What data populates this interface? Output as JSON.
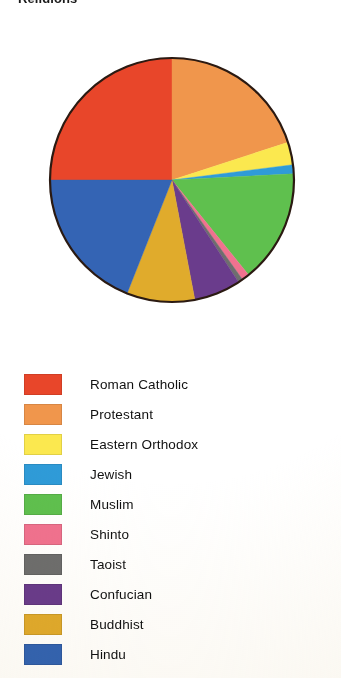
{
  "title": "Religions",
  "chart_data": {
    "type": "pie",
    "title": "Religions",
    "xlabel": "",
    "ylabel": "",
    "legend_position": "bottom",
    "grid": false,
    "start_angle_deg": 0,
    "direction": "clockwise",
    "categories": [
      "Roman Catholic",
      "Protestant",
      "Eastern Orthodox",
      "Jewish",
      "Muslim",
      "Shinto",
      "Taoist",
      "Confucian",
      "Buddhist",
      "Hindu"
    ],
    "values": [
      25.0,
      20.0,
      3.0,
      1.2,
      15.0,
      1.0,
      0.6,
      6.2,
      9.0,
      19.0
    ],
    "colors": [
      "#e8462a",
      "#f0964c",
      "#fbe84f",
      "#2f9bd8",
      "#5fc04e",
      "#f0728f",
      "#6e6e6e",
      "#6a3c8c",
      "#e0ab2c",
      "#3464b4"
    ],
    "slices": [
      {
        "label": "Roman Catholic",
        "value": 25.0,
        "color": "#e8462a",
        "start_deg": 270.0,
        "end_deg": 360.0
      },
      {
        "label": "Protestant",
        "value": 20.0,
        "color": "#f0964c",
        "start_deg": 0.0,
        "end_deg": 72.0
      },
      {
        "label": "Eastern Orthodox",
        "value": 3.0,
        "color": "#fbe84f",
        "start_deg": 72.0,
        "end_deg": 82.8
      },
      {
        "label": "Jewish",
        "value": 1.2,
        "color": "#2f9bd8",
        "start_deg": 82.8,
        "end_deg": 87.1
      },
      {
        "label": "Muslim",
        "value": 15.0,
        "color": "#5fc04e",
        "start_deg": 87.1,
        "end_deg": 141.1
      },
      {
        "label": "Shinto",
        "value": 1.0,
        "color": "#f0728f",
        "start_deg": 141.1,
        "end_deg": 144.7
      },
      {
        "label": "Taoist",
        "value": 0.6,
        "color": "#6e6e6e",
        "start_deg": 144.7,
        "end_deg": 146.9
      },
      {
        "label": "Confucian",
        "value": 6.2,
        "color": "#6a3c8c",
        "start_deg": 146.9,
        "end_deg": 169.2
      },
      {
        "label": "Buddhist",
        "value": 9.0,
        "color": "#e0ab2c",
        "start_deg": 169.2,
        "end_deg": 201.6
      },
      {
        "label": "Hindu",
        "value": 19.0,
        "color": "#3464b4",
        "start_deg": 201.6,
        "end_deg": 270.0
      }
    ]
  },
  "pie": {
    "center_x": 172,
    "center_y": 180,
    "radius": 122,
    "outline_color": "#2b1a12"
  },
  "legend": {
    "items": [
      {
        "label": "Roman Catholic",
        "color": "#e8462a"
      },
      {
        "label": "Protestant",
        "color": "#f0964c"
      },
      {
        "label": "Eastern Orthodox",
        "color": "#fbe84f"
      },
      {
        "label": "Jewish",
        "color": "#2f9bd8"
      },
      {
        "label": "Muslim",
        "color": "#5fc04e"
      },
      {
        "label": "Shinto",
        "color": "#f0728f"
      },
      {
        "label": "Taoist",
        "color": "#6e6e6e"
      },
      {
        "label": "Confucian",
        "color": "#6a3c8c"
      },
      {
        "label": "Buddhist",
        "color": "#e0ab2c"
      },
      {
        "label": "Hindu",
        "color": "#3464b4"
      }
    ]
  }
}
